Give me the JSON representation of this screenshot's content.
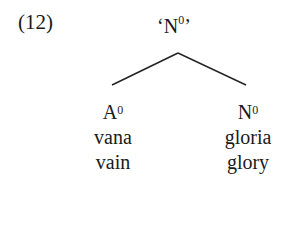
{
  "example": {
    "number": "(12)",
    "root": {
      "open_quote": "‘",
      "base": "N",
      "sup": "0",
      "close_quote": "’"
    },
    "children": [
      {
        "category_base": "A",
        "category_sup": "0",
        "word": "vana",
        "gloss": "vain"
      },
      {
        "category_base": "N",
        "category_sup": "0",
        "word": "gloria",
        "gloss": "glory"
      }
    ]
  }
}
